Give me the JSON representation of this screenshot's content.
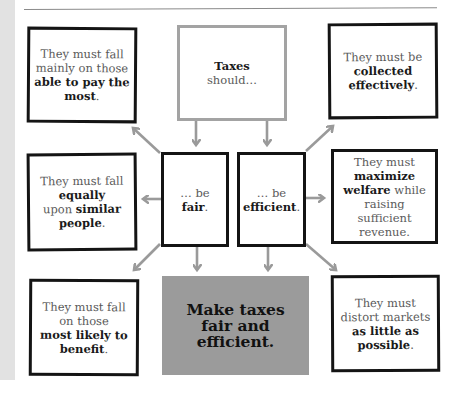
{
  "diagram": {
    "title_box": {
      "bold": "Taxes",
      "rest": "should…"
    },
    "fair_box": {
      "prefix": "… be",
      "bold": "fair",
      "suffix": "."
    },
    "efficient_box": {
      "prefix": "… be",
      "bold": "efficient",
      "suffix": "."
    },
    "ability_box": {
      "line1": "They must fall",
      "line2": "mainly on those",
      "bold": "able to pay the most",
      "suffix": "."
    },
    "collection_box": {
      "line1": "They must be",
      "bold": "collected effectively",
      "suffix": "."
    },
    "equality_box": {
      "line1": "They must fall",
      "bold1": "equally",
      "line2": "upon",
      "bold2": "similar people",
      "suffix": "."
    },
    "welfare_box": {
      "line1": "They must",
      "bold": "maximize welfare",
      "line2": "while raising sufficient revenue."
    },
    "benefit_box": {
      "line1": "They must fall on those",
      "bold": "most likely to benefit",
      "suffix": "."
    },
    "distortion_box": {
      "line1": "They must distort markets",
      "bold": "as little as possible",
      "suffix": "."
    },
    "conclusion_box": {
      "text": "Make taxes fair and efficient."
    },
    "colors": {
      "box_border": "#141414",
      "title_border": "#a3a3a3",
      "arrow": "#9a9a9a",
      "conclusion_fill": "#9b9b9b",
      "side_strip": "#e2e2e2"
    }
  }
}
